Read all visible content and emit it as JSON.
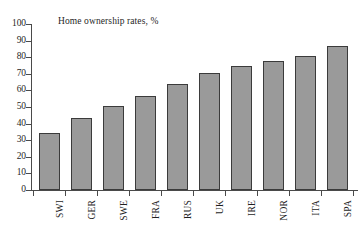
{
  "chart_data": {
    "type": "bar",
    "title": "Home ownership rates, %",
    "xlabel": "",
    "ylabel": "",
    "ylim": [
      0,
      100
    ],
    "ytick_step": 10,
    "grid": false,
    "legend": false,
    "orientation": "vertical",
    "bar_color": "#9a9a9a",
    "bar_edge_color": "#3b3b3b",
    "axis_color": "#4a4a4a",
    "background": "#ffffff",
    "xtick_label_rotation": 90,
    "categories": [
      "SWI",
      "GER",
      "SWE",
      "FRA",
      "RUS",
      "UK",
      "IRE",
      "NOR",
      "ITA",
      "SPA"
    ],
    "values": [
      34.5,
      43.5,
      50.5,
      56.5,
      64,
      70.5,
      75,
      77.5,
      80.5,
      87
    ],
    "ytick_labels": [
      "100",
      "90",
      "80",
      "70",
      "60",
      "50",
      "40",
      "30",
      "20",
      "10",
      "0"
    ],
    "ytick_values": [
      100,
      90,
      80,
      70,
      60,
      50,
      40,
      30,
      20,
      10,
      0
    ]
  }
}
